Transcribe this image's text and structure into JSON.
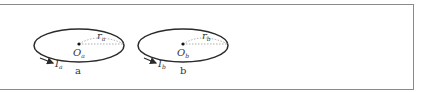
{
  "figure": {
    "loops": [
      {
        "id": "a",
        "caption": "a",
        "center_label": "O",
        "center_sub": "a",
        "radius_label": "r",
        "radius_sub": "a",
        "current_label": "I",
        "current_sub": "a"
      },
      {
        "id": "b",
        "caption": "b",
        "center_label": "O",
        "center_sub": "b",
        "radius_label": "r",
        "radius_sub": "b",
        "current_label": "I",
        "current_sub": "b"
      }
    ],
    "colors": {
      "border": "#8a8a8a",
      "stroke": "#2a2a2a",
      "dotted": "#9a9a9a"
    }
  }
}
